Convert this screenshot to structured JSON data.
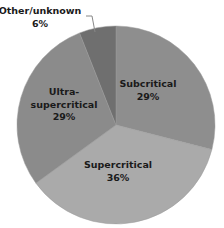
{
  "chart_data": {
    "type": "pie",
    "title": "",
    "categories": [
      "Subcritical",
      "Supercritical",
      "Ultra-supercritical",
      "Other/unknown"
    ],
    "values": [
      29,
      36,
      29,
      6
    ],
    "unit": "%",
    "colors": [
      "#8e8e8e",
      "#aaaaaa",
      "#8b8b8b",
      "#6f6f6f"
    ],
    "start_angle_deg": 0,
    "direction": "clockwise",
    "labels": [
      {
        "lines": [
          "Subcritical",
          "29%"
        ],
        "position": "inside"
      },
      {
        "lines": [
          "Supercritical",
          "36%"
        ],
        "position": "inside"
      },
      {
        "lines": [
          "Ultra-",
          "supercritical",
          "29%"
        ],
        "position": "inside"
      },
      {
        "lines": [
          "Other/unknown",
          "6%"
        ],
        "position": "outside-with-leader"
      }
    ],
    "legend": "none"
  }
}
